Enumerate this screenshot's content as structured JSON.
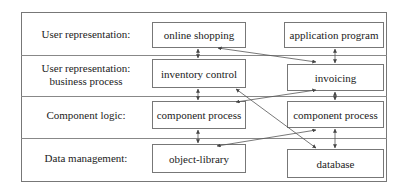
{
  "diagram": {
    "rows": [
      {
        "label": "User representation:",
        "label_line2": ""
      },
      {
        "label": "User representation:",
        "label_line2": "business process"
      },
      {
        "label": "Component logic:",
        "label_line2": ""
      },
      {
        "label": "Data management:",
        "label_line2": ""
      }
    ],
    "boxes": {
      "online_shopping": "online shopping",
      "application_program": "application program",
      "inventory_control": "inventory control",
      "invoicing": "invoicing",
      "component_process_left": "component process",
      "component_process_right": "component process",
      "object_library": "object-library",
      "database": "database"
    },
    "connections": [
      {
        "from": "online shopping",
        "to": "inventory control",
        "type": "bidirectional"
      },
      {
        "from": "online shopping",
        "to": "invoicing",
        "type": "bidirectional"
      },
      {
        "from": "application program",
        "to": "invoicing",
        "type": "bidirectional"
      },
      {
        "from": "inventory control",
        "to": "component process (left)",
        "type": "bidirectional"
      },
      {
        "from": "inventory control",
        "to": "database",
        "type": "bidirectional"
      },
      {
        "from": "invoicing",
        "to": "component process (left)",
        "type": "bidirectional"
      },
      {
        "from": "invoicing",
        "to": "component process (right)",
        "type": "bidirectional"
      },
      {
        "from": "component process (left)",
        "to": "object-library",
        "type": "bidirectional"
      },
      {
        "from": "component process (right)",
        "to": "object-library",
        "type": "bidirectional"
      },
      {
        "from": "component process (right)",
        "to": "database",
        "type": "bidirectional"
      }
    ],
    "colors": {
      "line": "#555555",
      "border": "#777777",
      "text": "#222222"
    }
  }
}
